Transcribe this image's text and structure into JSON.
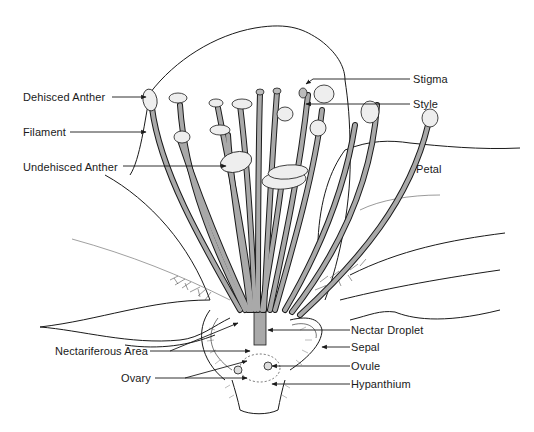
{
  "diagram": {
    "colors": {
      "ink": "#1a1a1a",
      "filament_fill": "#a9a9a9",
      "anther_fill": "#eeeeee",
      "background": "#ffffff"
    },
    "labels": {
      "dehisced_anther": "Dehisced Anther",
      "filament": "Filament",
      "undehisced_anther": "Undehisced Anther",
      "stigma": "Stigma",
      "style": "Style",
      "petal": "Petal",
      "nectariferous_area": "Nectariferous Area",
      "ovary": "Ovary",
      "nectar_droplet": "Nectar Droplet",
      "sepal": "Sepal",
      "ovule": "Ovule",
      "hypanthium": "Hypanthium"
    }
  }
}
